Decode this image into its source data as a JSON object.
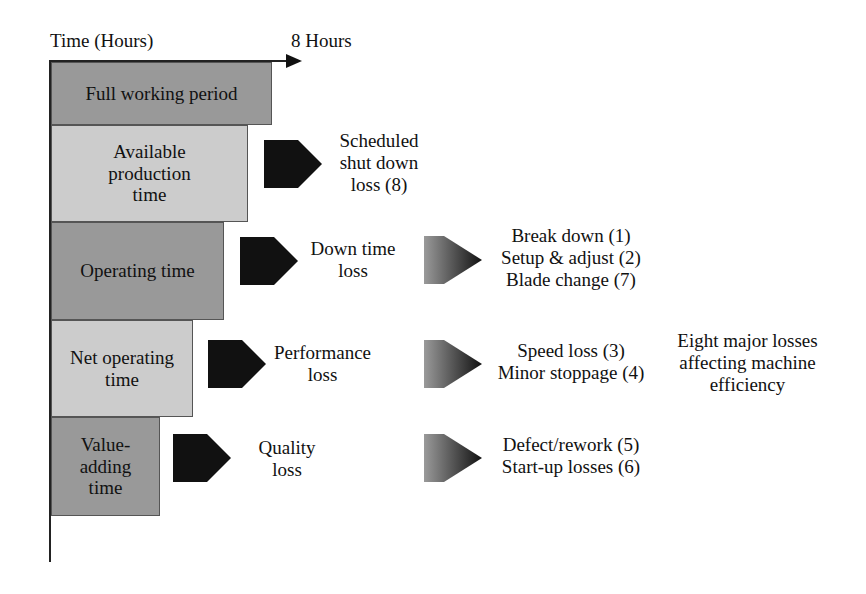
{
  "axis": {
    "y_label": "Time (Hours)",
    "x_end_label": "8 Hours"
  },
  "bars": [
    {
      "label": "Full working period",
      "shade": "dark"
    },
    {
      "label": "Available\nproduction\ntime",
      "shade": "light"
    },
    {
      "label": "Operating time",
      "shade": "dark"
    },
    {
      "label": "Net operating\ntime",
      "shade": "light"
    },
    {
      "label": "Value-\nadding\ntime",
      "shade": "dark"
    }
  ],
  "losses": [
    {
      "label": "Scheduled\nshut down\nloss (8)"
    },
    {
      "label": "Down time\nloss"
    },
    {
      "label": "Performance\nloss"
    },
    {
      "label": "Quality\nloss"
    }
  ],
  "loss_details": [
    {
      "label": "Break down (1)\nSetup & adjust (2)\nBlade change (7)"
    },
    {
      "label": "Speed loss (3)\nMinor stoppage (4)"
    },
    {
      "label": "Defect/rework (5)\nStart-up losses (6)"
    }
  ],
  "summary": "Eight major losses\naffecting machine\nefficiency",
  "colors": {
    "bar_dark": "#999999",
    "bar_light": "#cccccc",
    "arrow_solid": "#111111",
    "arrow_gradient_start": "#9a9a9a",
    "arrow_gradient_end": "#111111"
  }
}
